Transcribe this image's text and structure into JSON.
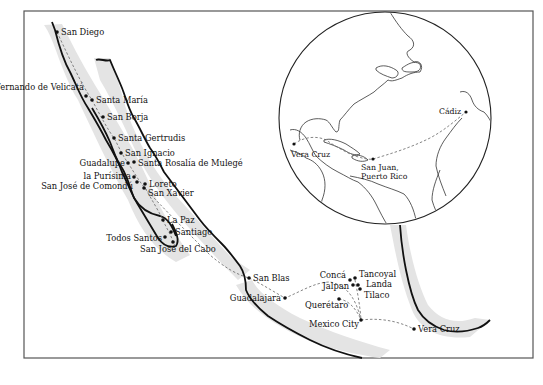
{
  "map": {
    "places": [
      {
        "name": "San Diego",
        "x": 57,
        "y": 32
      },
      {
        "name": "San Fernando de Velicatá",
        "x": 86,
        "y": 96
      },
      {
        "name": "Santa María",
        "x": 92,
        "y": 100
      },
      {
        "name": "San Borja",
        "x": 103,
        "y": 117
      },
      {
        "name": "Santa Gertrudis",
        "x": 114,
        "y": 138
      },
      {
        "name": "San Ignacio",
        "x": 121,
        "y": 153
      },
      {
        "name": "Guadalupe",
        "x": 128,
        "y": 163
      },
      {
        "name": "Santa Rosalía de Mulegé",
        "x": 134,
        "y": 162
      },
      {
        "name": "la Purísima",
        "x": 134,
        "y": 177
      },
      {
        "name": "San José de Comondú",
        "x": 137,
        "y": 182
      },
      {
        "name": "Loreto",
        "x": 145,
        "y": 184
      },
      {
        "name": "San Xavier",
        "x": 144,
        "y": 188
      },
      {
        "name": "La Paz",
        "x": 163,
        "y": 220
      },
      {
        "name": "Santiago",
        "x": 171,
        "y": 232
      },
      {
        "name": "Todos Santos",
        "x": 165,
        "y": 237
      },
      {
        "name": "San José del Cabo",
        "x": 173,
        "y": 242
      },
      {
        "name": "San Blas",
        "x": 249,
        "y": 278
      },
      {
        "name": "Guadalajara",
        "x": 285,
        "y": 298
      },
      {
        "name": "Concá",
        "x": 350,
        "y": 280
      },
      {
        "name": "Tancoyal",
        "x": 355,
        "y": 278
      },
      {
        "name": "Jalpan",
        "x": 353,
        "y": 285
      },
      {
        "name": "Landa",
        "x": 358,
        "y": 285
      },
      {
        "name": "Tilaco",
        "x": 360,
        "y": 289
      },
      {
        "name": "Querétaro",
        "x": 339,
        "y": 299
      },
      {
        "name": "Mexico City",
        "x": 361,
        "y": 320
      },
      {
        "name": "Vera Cruz",
        "x": 414,
        "y": 329
      }
    ],
    "inset": {
      "places": [
        {
          "name": "Cádiz",
          "x": 466,
          "y": 112
        },
        {
          "name": "Vera Cruz",
          "x": 294,
          "y": 144
        },
        {
          "name": "San Juan,",
          "line2": "Puerto Rico",
          "x": 373,
          "y": 159
        }
      ]
    },
    "colors": {
      "coast": "#111111",
      "shading": "#e4e4e4",
      "route": "#666666",
      "frame": "#555555"
    }
  }
}
